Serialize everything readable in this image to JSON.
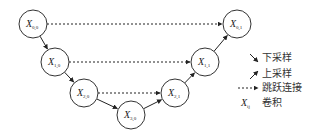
{
  "diagram": {
    "nodes": [
      {
        "id": "X00",
        "base": "X",
        "sub": "0,0",
        "cx": 33,
        "cy": 24
      },
      {
        "id": "X10",
        "base": "X",
        "sub": "1,0",
        "cx": 55,
        "cy": 62
      },
      {
        "id": "X20",
        "base": "X",
        "sub": "2,0",
        "cx": 84,
        "cy": 93
      },
      {
        "id": "X30",
        "base": "X",
        "sub": "3,0",
        "cx": 131,
        "cy": 115
      },
      {
        "id": "X21",
        "base": "X",
        "sub": "2,1",
        "cx": 175,
        "cy": 93
      },
      {
        "id": "X11",
        "base": "X",
        "sub": "1,1",
        "cx": 205,
        "cy": 62
      },
      {
        "id": "X01",
        "base": "X",
        "sub": "0,1",
        "cx": 237,
        "cy": 24
      }
    ],
    "edges": [
      {
        "from": "X00",
        "to": "X10",
        "type": "downsample"
      },
      {
        "from": "X10",
        "to": "X20",
        "type": "downsample"
      },
      {
        "from": "X20",
        "to": "X30",
        "type": "downsample"
      },
      {
        "from": "X30",
        "to": "X21",
        "type": "upsample"
      },
      {
        "from": "X21",
        "to": "X11",
        "type": "upsample"
      },
      {
        "from": "X11",
        "to": "X01",
        "type": "upsample"
      },
      {
        "from": "X00",
        "to": "X01",
        "type": "skip"
      },
      {
        "from": "X10",
        "to": "X11",
        "type": "skip"
      },
      {
        "from": "X20",
        "to": "X21",
        "type": "skip"
      }
    ],
    "legend": [
      {
        "symbol": "downsample-arrow",
        "label": "下采样"
      },
      {
        "symbol": "upsample-arrow",
        "label": "上采样"
      },
      {
        "symbol": "skip-arrow",
        "label": "跳跃连接"
      },
      {
        "symbol": "X",
        "symbol_sub": "ij",
        "label": "卷积"
      }
    ]
  }
}
